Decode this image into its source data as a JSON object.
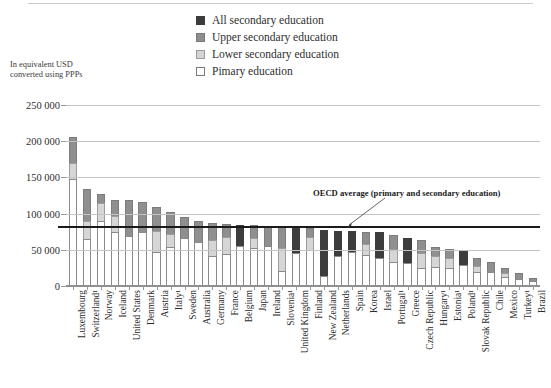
{
  "legend": {
    "items": [
      {
        "label": "All secondary education",
        "swatch": "all",
        "color": "#3d3d3d"
      },
      {
        "label": "Upper secondary education",
        "swatch": "upper",
        "color": "#8f8f8f"
      },
      {
        "label": "Lower secondary education",
        "swatch": "lower",
        "color": "#d6d6d6"
      },
      {
        "label": "Pimary education",
        "swatch": "primary",
        "color": "#ffffff"
      }
    ]
  },
  "axis_caption": "In equivalent USD\nconverted using PPPs",
  "annotation": {
    "oecd_average_label": "OECD average (primary and secondary education)",
    "oecd_average_value": 80000
  },
  "chart_data": {
    "type": "bar",
    "subtype": "stacked-bar",
    "title": "",
    "xlabel": "",
    "ylabel": "In equivalent USD converted using PPPs",
    "ylim": [
      0,
      250000
    ],
    "yticks": [
      0,
      50000,
      100000,
      150000,
      200000,
      250000
    ],
    "ytick_labels": [
      "0",
      "50 000",
      "100 000",
      "150 000",
      "200 000",
      "250 000"
    ],
    "grid": true,
    "legend_position": "top-center",
    "series": [
      {
        "name": "Primary education",
        "key": "primary",
        "color": "#ffffff"
      },
      {
        "name": "Lower secondary education",
        "key": "lower",
        "color": "#d6d6d6"
      },
      {
        "name": "Upper secondary education",
        "key": "upper",
        "color": "#8f8f8f"
      },
      {
        "name": "All secondary education",
        "key": "all",
        "color": "#3d3d3d"
      }
    ],
    "reference_line": {
      "label": "OECD average (primary and secondary education)",
      "value": 80000
    },
    "categories": [
      "Luxembourg",
      "Switzerland¹",
      "Norway",
      "Iceland",
      "United States",
      "Denmark",
      "Austria",
      "Italy¹",
      "Sweden",
      "Australia",
      "Germany",
      "France",
      "Belgium",
      "Japan",
      "Ireland",
      "Slovenia¹",
      "United Kingdom",
      "Finland",
      "New Zealand",
      "Netherlands",
      "Spain",
      "Korea",
      "Israel",
      "Portugal¹",
      "Greece",
      "Czech Republic",
      "Hungary¹",
      "Estonia¹",
      "Poland¹",
      "Slovak Republic",
      "Chile",
      "Mexico",
      "Turkey¹",
      "Brazil"
    ],
    "points": [
      {
        "category": "Luxembourg",
        "footnote": "",
        "primary": 146000,
        "lower": 23000,
        "upper": 36000,
        "all": 0,
        "total": 205000
      },
      {
        "category": "Switzerland",
        "footnote": "1",
        "primary": 64000,
        "lower": 25000,
        "upper": 44000,
        "all": 0,
        "total": 133000
      },
      {
        "category": "Norway",
        "footnote": "",
        "primary": 88000,
        "lower": 25000,
        "upper": 13000,
        "all": 0,
        "total": 126000
      },
      {
        "category": "Iceland",
        "footnote": "",
        "primary": 73000,
        "lower": 22000,
        "upper": 22000,
        "all": 0,
        "total": 117000
      },
      {
        "category": "United States",
        "footnote": "",
        "primary": 68000,
        "lower": 0,
        "upper": 49000,
        "all": 0,
        "total": 117000
      },
      {
        "category": "Denmark",
        "footnote": "",
        "primary": 73000,
        "lower": 0,
        "upper": 42000,
        "all": 0,
        "total": 115000
      },
      {
        "category": "Austria",
        "footnote": "",
        "primary": 45000,
        "lower": 29000,
        "upper": 34000,
        "all": 0,
        "total": 108000
      },
      {
        "category": "Italy",
        "footnote": "1",
        "primary": 53000,
        "lower": 18000,
        "upper": 30000,
        "all": 0,
        "total": 101000
      },
      {
        "category": "Sweden",
        "footnote": "",
        "primary": 65000,
        "lower": 0,
        "upper": 29000,
        "all": 0,
        "total": 94000
      },
      {
        "category": "Australia",
        "footnote": "",
        "primary": 60000,
        "lower": 0,
        "upper": 28000,
        "all": 0,
        "total": 88000
      },
      {
        "category": "Germany",
        "footnote": "",
        "primary": 40000,
        "lower": 22000,
        "upper": 24000,
        "all": 0,
        "total": 86000
      },
      {
        "category": "France",
        "footnote": "",
        "primary": 43000,
        "lower": 23000,
        "upper": 18000,
        "all": 0,
        "total": 84000
      },
      {
        "category": "Belgium",
        "footnote": "",
        "primary": 54000,
        "lower": 0,
        "upper": 0,
        "all": 29000,
        "total": 83000
      },
      {
        "category": "Japan",
        "footnote": "",
        "primary": 51000,
        "lower": 14000,
        "upper": 18000,
        "all": 0,
        "total": 83000
      },
      {
        "category": "Ireland",
        "footnote": "",
        "primary": 54000,
        "lower": 0,
        "upper": 27000,
        "all": 0,
        "total": 81000
      },
      {
        "category": "Slovenia",
        "footnote": "1",
        "primary": 20000,
        "lower": 31000,
        "upper": 29000,
        "all": 0,
        "total": 80000
      },
      {
        "category": "United Kingdom",
        "footnote": "",
        "primary": 44000,
        "lower": 0,
        "upper": 0,
        "all": 35000,
        "total": 79000
      },
      {
        "category": "Finland",
        "footnote": "",
        "primary": 49000,
        "lower": 18000,
        "upper": 12000,
        "all": 0,
        "total": 79000
      },
      {
        "category": "New Zealand",
        "footnote": "",
        "primary": 13000,
        "lower": 0,
        "upper": 0,
        "all": 63000,
        "total": 76000
      },
      {
        "category": "Netherlands",
        "footnote": "",
        "primary": 40000,
        "lower": 0,
        "upper": 0,
        "all": 35000,
        "total": 75000
      },
      {
        "category": "Spain",
        "footnote": "",
        "primary": 46000,
        "lower": 0,
        "upper": 0,
        "all": 28000,
        "total": 74000
      },
      {
        "category": "Korea",
        "footnote": "",
        "primary": 41000,
        "lower": 15000,
        "upper": 17000,
        "all": 0,
        "total": 73000
      },
      {
        "category": "Israel",
        "footnote": "",
        "primary": 37000,
        "lower": 0,
        "upper": 0,
        "all": 36000,
        "total": 73000
      },
      {
        "category": "Portugal",
        "footnote": "1",
        "primary": 32000,
        "lower": 18000,
        "upper": 19000,
        "all": 0,
        "total": 69000
      },
      {
        "category": "Greece",
        "footnote": "",
        "primary": 31000,
        "lower": 0,
        "upper": 0,
        "all": 34000,
        "total": 65000
      },
      {
        "category": "Czech Republic",
        "footnote": "",
        "primary": 24000,
        "lower": 20000,
        "upper": 18000,
        "all": 0,
        "total": 62000
      },
      {
        "category": "Hungary",
        "footnote": "1",
        "primary": 25000,
        "lower": 15000,
        "upper": 13000,
        "all": 0,
        "total": 53000
      },
      {
        "category": "Estonia",
        "footnote": "1",
        "primary": 23000,
        "lower": 14000,
        "upper": 13000,
        "all": 0,
        "total": 50000
      },
      {
        "category": "Poland",
        "footnote": "1",
        "primary": 27000,
        "lower": 0,
        "upper": 0,
        "all": 21000,
        "total": 48000
      },
      {
        "category": "Slovak Republic",
        "footnote": "",
        "primary": 18000,
        "lower": 8000,
        "upper": 12000,
        "all": 0,
        "total": 38000
      },
      {
        "category": "Chile",
        "footnote": "",
        "primary": 18000,
        "lower": 0,
        "upper": 14000,
        "all": 0,
        "total": 32000
      },
      {
        "category": "Mexico",
        "footnote": "",
        "primary": 11000,
        "lower": 6000,
        "upper": 6000,
        "all": 0,
        "total": 23000
      },
      {
        "category": "Turkey",
        "footnote": "1",
        "primary": 8000,
        "lower": 0,
        "upper": 8000,
        "all": 0,
        "total": 16000
      },
      {
        "category": "Brazil",
        "footnote": "",
        "primary": 6000,
        "lower": 0,
        "upper": 4000,
        "all": 0,
        "total": 10000
      }
    ]
  }
}
